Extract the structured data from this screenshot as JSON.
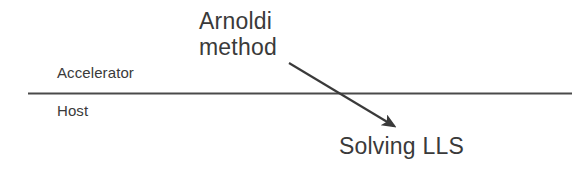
{
  "diagram": {
    "background_color": "#ffffff",
    "stroke_color": "#3a3a3a",
    "regions": {
      "upper_label": "Accelerator",
      "lower_label": "Host"
    },
    "divider": {
      "name": "horizontal-divider-line",
      "x1": 28,
      "y1": 93,
      "x2": 572,
      "y2": 93,
      "color": "#4a4a4a",
      "width": 2
    },
    "annotations": {
      "arnoldi": {
        "line1": "Arnoldi",
        "line2": "method"
      },
      "target": "Solving LLS"
    },
    "arrow": {
      "name": "arnoldi-to-lls-arrow",
      "from_x": 289,
      "from_y": 63,
      "to_x": 398,
      "to_y": 129,
      "color": "#3a3a3a",
      "width": 2
    }
  }
}
